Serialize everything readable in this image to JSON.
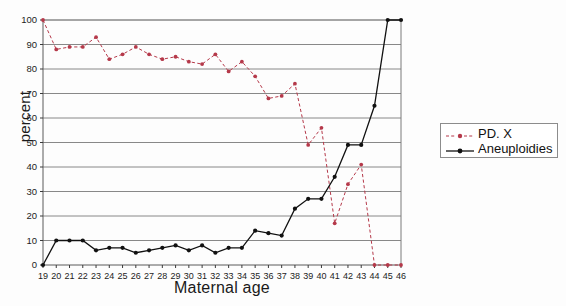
{
  "chart_data": {
    "type": "line",
    "title": "",
    "xlabel": "Maternal age",
    "ylabel": "percent",
    "xlim": [
      19,
      46
    ],
    "ylim": [
      0,
      100
    ],
    "grid": true,
    "legend_position": "right-outside",
    "categories": [
      19,
      20,
      21,
      22,
      23,
      24,
      25,
      26,
      27,
      28,
      29,
      30,
      31,
      32,
      33,
      34,
      35,
      36,
      37,
      38,
      39,
      40,
      41,
      42,
      43,
      44,
      45,
      46
    ],
    "xtick_labels": [
      "19",
      "20",
      "21",
      "22",
      "23",
      "24",
      "25",
      "26",
      "27",
      "28",
      "29",
      "30",
      "31",
      "32",
      "33",
      "34",
      "35",
      "36",
      "37",
      "38",
      "39",
      "40",
      "41",
      "42",
      "43",
      "44",
      "45",
      "46"
    ],
    "ytick_labels": [
      "0",
      "10",
      "20",
      "30",
      "40",
      "50",
      "60",
      "70",
      "80",
      "90",
      "100"
    ],
    "ytick_values": [
      0,
      10,
      20,
      30,
      40,
      50,
      60,
      70,
      80,
      90,
      100
    ],
    "series": [
      {
        "name": "PD. X",
        "color": "#b5394a",
        "style": "dashed",
        "marker": "circle",
        "values": [
          100,
          88,
          89,
          89,
          93,
          84,
          86,
          89,
          86,
          84,
          85,
          83,
          82,
          86,
          79,
          83,
          77,
          68,
          69,
          74,
          49,
          56,
          17,
          33,
          41,
          0,
          0,
          0
        ]
      },
      {
        "name": "Aneuploidies",
        "color": "#111111",
        "style": "solid",
        "marker": "circle",
        "values": [
          0,
          10,
          10,
          10,
          6,
          7,
          7,
          5,
          6,
          7,
          8,
          6,
          8,
          5,
          7,
          7,
          14,
          13,
          12,
          23,
          27,
          27,
          36,
          49,
          49,
          65,
          100,
          100
        ]
      }
    ]
  },
  "legend": {
    "items": [
      {
        "label": "PD. X"
      },
      {
        "label": "Aneuploidies"
      }
    ]
  },
  "axes": {
    "x_title": "Maternal age",
    "y_title": "percent"
  }
}
